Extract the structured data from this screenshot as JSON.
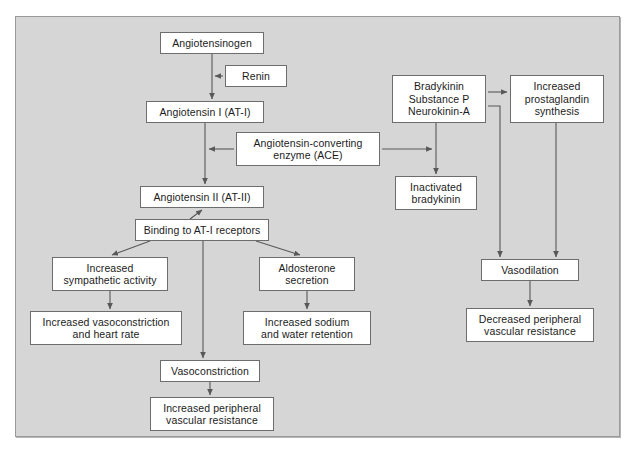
{
  "diagram": {
    "panel": {
      "background_color": "#d6d6d6",
      "border_color": "#9a9a9a"
    },
    "node_style": {
      "fill_color": "#ffffff",
      "border_color": "#6d6d6d",
      "text_color": "#1b1b1b"
    },
    "connector_color": "#58585a",
    "nodes": [
      {
        "id": "angiotensinogen",
        "label": "Angiotensinogen",
        "x": 160,
        "y": 32,
        "w": 104,
        "h": 22
      },
      {
        "id": "renin",
        "label": "Renin",
        "x": 225,
        "y": 65,
        "w": 62,
        "h": 22
      },
      {
        "id": "angiotensin-i",
        "label": "Angiotensin I (AT-I)",
        "x": 146,
        "y": 101,
        "w": 118,
        "h": 22
      },
      {
        "id": "ace",
        "label": "Angiotensin-converting\nenzyme (ACE)",
        "x": 236,
        "y": 132,
        "w": 144,
        "h": 34
      },
      {
        "id": "angiotensin-ii",
        "label": "Angiotensin II (AT-II)",
        "x": 140,
        "y": 186,
        "w": 124,
        "h": 22
      },
      {
        "id": "binding-at1",
        "label": "Binding to AT-I receptors",
        "x": 135,
        "y": 219,
        "w": 134,
        "h": 22
      },
      {
        "id": "increased-sympathetic",
        "label": "Increased\nsympathetic activity",
        "x": 52,
        "y": 257,
        "w": 116,
        "h": 34
      },
      {
        "id": "increased-vasoconstriction",
        "label": "Increased vasoconstriction\nand heart rate",
        "x": 30,
        "y": 311,
        "w": 152,
        "h": 34
      },
      {
        "id": "aldosterone-secretion",
        "label": "Aldosterone\nsecretion",
        "x": 259,
        "y": 257,
        "w": 96,
        "h": 34
      },
      {
        "id": "increased-sodium",
        "label": "Increased sodium\nand water retention",
        "x": 243,
        "y": 311,
        "w": 128,
        "h": 34
      },
      {
        "id": "vasoconstriction",
        "label": "Vasoconstriction",
        "x": 160,
        "y": 360,
        "w": 100,
        "h": 22
      },
      {
        "id": "increased-peripheral",
        "label": "Increased peripheral\nvascular resistance",
        "x": 150,
        "y": 397,
        "w": 124,
        "h": 34
      },
      {
        "id": "bradykinin-group",
        "label": "Bradykinin\nSubstance P\nNeurokinin-A",
        "x": 392,
        "y": 75,
        "w": 94,
        "h": 48
      },
      {
        "id": "increased-prostaglandin",
        "label": "Increased\nprostaglandin\nsynthesis",
        "x": 510,
        "y": 75,
        "w": 94,
        "h": 48
      },
      {
        "id": "inactivated-bradykinin",
        "label": "Inactivated\nbradykinin",
        "x": 395,
        "y": 176,
        "w": 82,
        "h": 34
      },
      {
        "id": "vasodilation",
        "label": "Vasodilation",
        "x": 481,
        "y": 259,
        "w": 98,
        "h": 22
      },
      {
        "id": "decreased-peripheral",
        "label": "Decreased peripheral\nvascular resistance",
        "x": 466,
        "y": 308,
        "w": 128,
        "h": 34
      }
    ],
    "edges": [
      {
        "id": "edge-angiotensinogen-to-at1",
        "from": "angiotensinogen",
        "to": "angiotensin-i"
      },
      {
        "id": "edge-renin-to-conversion",
        "from": "renin",
        "to": "angiotensinogen-at1-line"
      },
      {
        "id": "edge-at1-to-at2",
        "from": "angiotensin-i",
        "to": "angiotensin-ii"
      },
      {
        "id": "edge-ace-to-at1at2-line",
        "from": "ace",
        "to": "angiotensin-i-to-ii-line"
      },
      {
        "id": "edge-ace-to-bradykinin-line",
        "from": "ace",
        "to": "bradykinin-inactivation-line"
      },
      {
        "id": "edge-binding-to-at2",
        "from": "binding-at1",
        "to": "angiotensin-ii"
      },
      {
        "id": "edge-binding-to-sympathetic",
        "from": "binding-at1",
        "to": "increased-sympathetic"
      },
      {
        "id": "edge-binding-to-aldosterone",
        "from": "binding-at1",
        "to": "aldosterone-secretion"
      },
      {
        "id": "edge-binding-to-vasoconstriction",
        "from": "binding-at1",
        "to": "vasoconstriction"
      },
      {
        "id": "edge-sympathetic-to-vasoconstriction",
        "from": "increased-sympathetic",
        "to": "increased-vasoconstriction"
      },
      {
        "id": "edge-aldosterone-to-sodium",
        "from": "aldosterone-secretion",
        "to": "increased-sodium"
      },
      {
        "id": "edge-vasoconstriction-to-peripheral",
        "from": "vasoconstriction",
        "to": "increased-peripheral"
      },
      {
        "id": "edge-bradykinin-to-prostaglandin",
        "from": "bradykinin-group",
        "to": "increased-prostaglandin"
      },
      {
        "id": "edge-bradykinin-to-inactivated",
        "from": "bradykinin-group",
        "to": "inactivated-bradykinin"
      },
      {
        "id": "edge-bradykinin-to-vasodilation",
        "from": "bradykinin-group",
        "to": "vasodilation"
      },
      {
        "id": "edge-prostaglandin-to-vasodilation",
        "from": "increased-prostaglandin",
        "to": "vasodilation"
      },
      {
        "id": "edge-vasodilation-to-decreased",
        "from": "vasodilation",
        "to": "decreased-peripheral"
      }
    ]
  }
}
